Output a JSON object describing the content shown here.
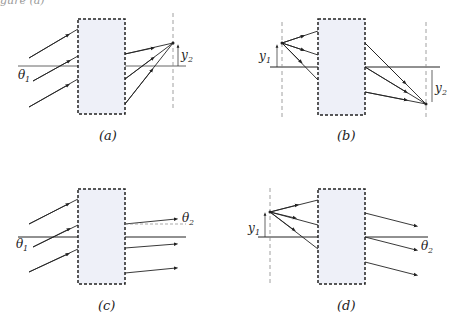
{
  "header": {
    "cut_text": "gure (a)"
  },
  "colors": {
    "box_fill": "#eef0f8",
    "box_stroke": "#222222",
    "axis": "#555555",
    "ray": "#222222",
    "dashed": "#888888"
  },
  "panels": [
    {
      "id": "a",
      "caption": "(a)",
      "labels": {
        "theta1": "θ",
        "theta1_sub": "1",
        "y2": "y",
        "y2_sub": "2"
      }
    },
    {
      "id": "b",
      "caption": "(b)",
      "labels": {
        "y1": "y",
        "y1_sub": "1",
        "y2": "y",
        "y2_sub": "2"
      }
    },
    {
      "id": "c",
      "caption": "(c)",
      "labels": {
        "theta1": "θ",
        "theta1_sub": "1",
        "theta2": "θ",
        "theta2_sub": "2"
      }
    },
    {
      "id": "d",
      "caption": "(d)",
      "labels": {
        "y1": "y",
        "y1_sub": "1",
        "theta2": "θ",
        "theta2_sub": "2"
      }
    }
  ]
}
